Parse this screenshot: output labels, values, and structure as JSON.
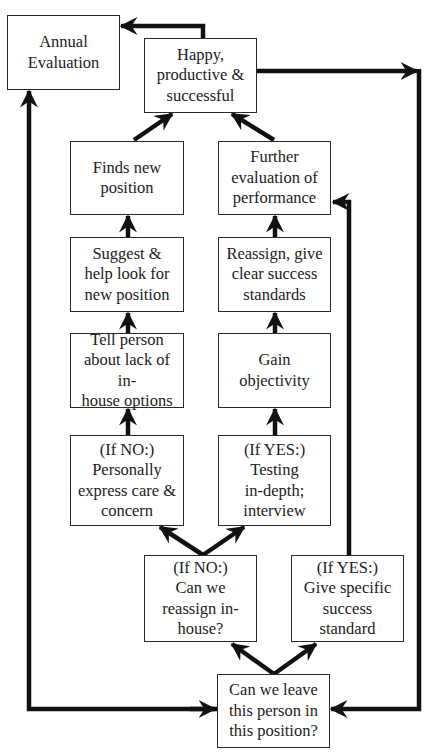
{
  "diagram": {
    "type": "flowchart",
    "nodes": {
      "annual_evaluation": "Annual\nEvaluation",
      "happy": "Happy,\nproductive &\nsuccessful",
      "finds_new_position": "Finds new\nposition",
      "further_evaluation": "Further\nevaluation of\nperformance",
      "suggest_help": "Suggest &\nhelp look for\nnew position",
      "reassign_clear": "Reassign, give\nclear success\nstandards",
      "tell_person": "Tell person\nabout lack of in-\nhouse options",
      "gain_objectivity": "Gain\nobjectivity",
      "if_no_care": "(If NO:)\nPersonally\nexpress care &\nconcern",
      "if_yes_testing": "(If YES:)\nTesting\nin-depth;\ninterview",
      "if_no_reassign": "(If NO:)\nCan we\nreassign in-\nhouse?",
      "if_yes_standard": "(If YES:)\nGive specific\nsuccess\nstandard",
      "can_we_leave": "Can we leave\nthis person in\nthis position?"
    },
    "edges": [
      {
        "from": "can_we_leave",
        "to": "if_no_reassign"
      },
      {
        "from": "can_we_leave",
        "to": "if_yes_standard"
      },
      {
        "from": "if_no_reassign",
        "to": "if_no_care"
      },
      {
        "from": "if_no_reassign",
        "to": "if_yes_testing"
      },
      {
        "from": "if_no_care",
        "to": "tell_person"
      },
      {
        "from": "tell_person",
        "to": "suggest_help"
      },
      {
        "from": "suggest_help",
        "to": "finds_new_position"
      },
      {
        "from": "finds_new_position",
        "to": "happy"
      },
      {
        "from": "if_yes_testing",
        "to": "gain_objectivity"
      },
      {
        "from": "gain_objectivity",
        "to": "reassign_clear"
      },
      {
        "from": "reassign_clear",
        "to": "further_evaluation"
      },
      {
        "from": "further_evaluation",
        "to": "happy"
      },
      {
        "from": "if_yes_standard",
        "to": "further_evaluation"
      },
      {
        "from": "happy",
        "to": "annual_evaluation"
      },
      {
        "from": "happy",
        "to": "can_we_leave"
      },
      {
        "from": "can_we_leave",
        "to": "annual_evaluation"
      }
    ],
    "colors": {
      "line": "#111111",
      "border": "#2a2a2a",
      "text": "#222222",
      "background": "#ffffff"
    }
  }
}
